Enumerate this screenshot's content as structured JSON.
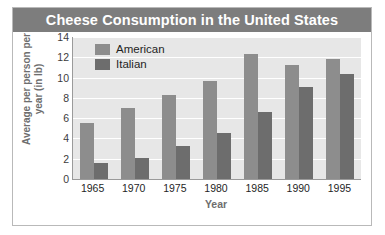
{
  "chart_data": {
    "type": "bar",
    "title": "Cheese Consumption in the United States",
    "xlabel": "Year",
    "ylabel": "Average per person per year (in lb)",
    "categories": [
      "1965",
      "1970",
      "1975",
      "1980",
      "1985",
      "1990",
      "1995"
    ],
    "series": [
      {
        "name": "American",
        "color": "#8d8d8d",
        "values": [
          5.5,
          7.0,
          8.3,
          9.7,
          12.3,
          11.2,
          11.8
        ]
      },
      {
        "name": "Italian",
        "color": "#6d6d6d",
        "values": [
          1.6,
          2.1,
          3.3,
          4.5,
          6.6,
          9.1,
          10.4
        ]
      }
    ],
    "ylim": [
      0,
      14
    ],
    "yticks": [
      0,
      2,
      4,
      6,
      8,
      10,
      12,
      14
    ],
    "ytick_labels": [
      "0",
      "2",
      "4",
      "6",
      "8",
      "10",
      "12",
      "14"
    ],
    "grid": true,
    "grid_color": "#ffffff",
    "legend_position": "top-left-inside",
    "plot_background": "#e7e7e7",
    "title_bar_color": "#7d7d7d",
    "title_text_color": "#ffffff",
    "axis_label_color": "#6e6e6e",
    "frame_color": "#b9b9b9"
  }
}
